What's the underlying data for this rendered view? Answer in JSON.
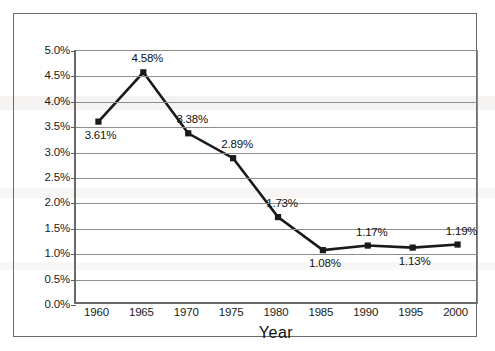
{
  "chart_data": {
    "type": "line",
    "title": "",
    "xlabel": "Year",
    "ylabel": "",
    "categories": [
      "1960",
      "1965",
      "1970",
      "1975",
      "1980",
      "1985",
      "1990",
      "1995",
      "2000"
    ],
    "values": [
      3.61,
      4.58,
      3.38,
      2.89,
      1.73,
      1.08,
      1.17,
      1.13,
      1.19
    ],
    "point_labels": [
      "3.61%",
      "4.58%",
      "3.38%",
      "2.89%",
      "1.73%",
      "1.08%",
      "1.17%",
      "1.13%",
      "1.19%"
    ],
    "label_positions": [
      "below",
      "above",
      "above",
      "above",
      "above",
      "below",
      "above",
      "below",
      "above"
    ],
    "ylim": [
      0.0,
      5.0
    ],
    "ytick_values": [
      0.0,
      0.5,
      1.0,
      1.5,
      2.0,
      2.5,
      3.0,
      3.5,
      4.0,
      4.5,
      5.0
    ],
    "ytick_labels": [
      "0.0%",
      "0.5%",
      "1.0%",
      "1.5%",
      "2.0%",
      "2.5%",
      "3.0%",
      "3.5%",
      "4.0%",
      "4.5%",
      "5.0%"
    ],
    "grid": true,
    "grid_axis": "y",
    "legend": false,
    "marker": "square",
    "series_color": "#1a1a1a",
    "grid_color": "#8d8d8d",
    "axis_color": "#5a5a5a",
    "frame_color": "#6b6b6b",
    "background": "#ffffff"
  }
}
